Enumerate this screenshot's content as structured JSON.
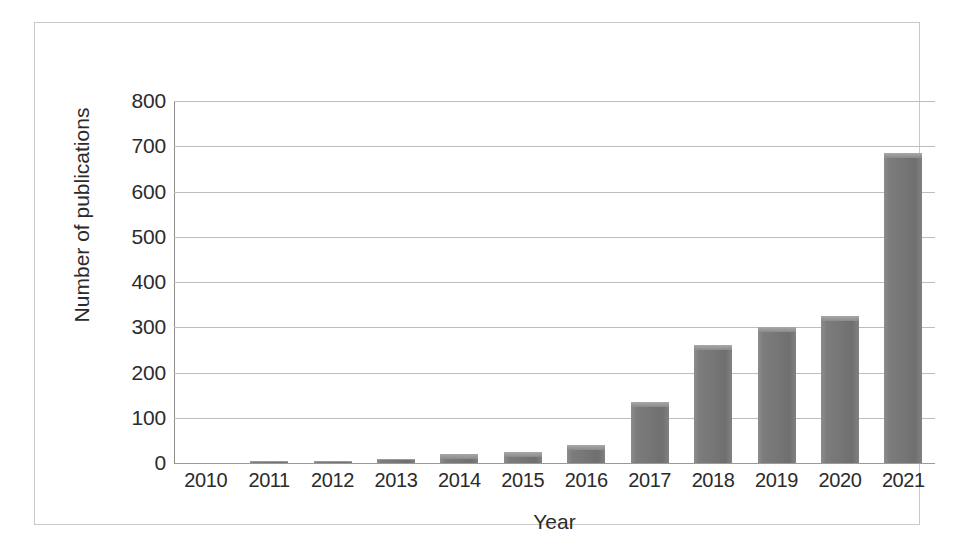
{
  "figure": {
    "background_color": "#ffffff",
    "frame_color": "#c9c9c9",
    "bar_color": "#7a7a7a",
    "grid_color": "#bdbdbd",
    "text_color": "#2b2b2b"
  },
  "chart_data": {
    "type": "bar",
    "title": "",
    "subtitle": "",
    "xlabel": "Year",
    "ylabel": "Number of publications",
    "categories": [
      "2010",
      "2011",
      "2012",
      "2013",
      "2014",
      "2015",
      "2016",
      "2017",
      "2018",
      "2019",
      "2020",
      "2021"
    ],
    "values": [
      0,
      5,
      5,
      8,
      20,
      25,
      40,
      135,
      260,
      300,
      325,
      685
    ],
    "ylim": [
      0,
      800
    ],
    "ytick_labels": [
      "800",
      "700",
      "600",
      "500",
      "400",
      "300",
      "200",
      "100",
      "0"
    ],
    "ytick_values": [
      800,
      700,
      600,
      500,
      400,
      300,
      200,
      100,
      0
    ],
    "ytick_step": 100,
    "grid": "horizontal",
    "legend": "none",
    "series_name": "Number of publications",
    "annotations": []
  }
}
